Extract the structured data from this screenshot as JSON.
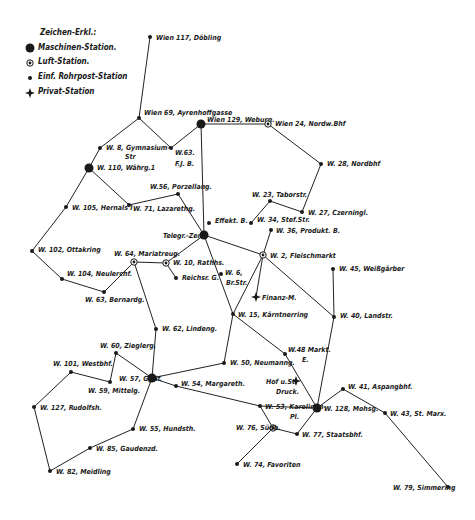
{
  "legend": {
    "title": "Zeichen-Erkl.:",
    "items": [
      {
        "symbol": "machine",
        "label": "Maschinen-Station."
      },
      {
        "symbol": "air",
        "label": "Luft-Station."
      },
      {
        "symbol": "simple",
        "label": "Einf. Rohrpost-Station"
      },
      {
        "symbol": "private",
        "label": "Privat-Station"
      }
    ]
  },
  "colors": {
    "ink": "#1a1a1a",
    "background": "#ffffff"
  },
  "nodes": [
    {
      "id": "w117",
      "label": "Wien 117, Döbling",
      "x": 150,
      "y": 37,
      "type": "simple",
      "lx": 156,
      "ly": 40
    },
    {
      "id": "w69",
      "label": "Wien 69, Ayrenhoffgasse",
      "x": 139,
      "y": 118,
      "type": "simple",
      "lx": 144,
      "ly": 115
    },
    {
      "id": "w129",
      "label": "Wien 129, Weburg.",
      "x": 201,
      "y": 124,
      "type": "machine",
      "lx": 207,
      "ly": 122
    },
    {
      "id": "w24",
      "label": "Wien 24, Nordw.Bhf",
      "x": 268,
      "y": 124,
      "type": "air",
      "lx": 275,
      "ly": 126
    },
    {
      "id": "w8",
      "label": "W. 8, Gymnasium-",
      "label2": "Str",
      "x": 100,
      "y": 148,
      "type": "simple",
      "lx": 106,
      "ly": 150,
      "l2x": 125,
      "l2y": 159
    },
    {
      "id": "w63a",
      "label": "W.63.",
      "label2": "F.J. B.",
      "x": 171,
      "y": 148,
      "type": "simple",
      "lx": 175,
      "ly": 155,
      "l2x": 175,
      "l2y": 166
    },
    {
      "id": "w28",
      "label": "W. 28, Nordbhf",
      "x": 321,
      "y": 164,
      "type": "simple",
      "lx": 327,
      "ly": 166
    },
    {
      "id": "w110",
      "label": "W. 110, Währg.1",
      "x": 89,
      "y": 168,
      "type": "machine",
      "lx": 97,
      "ly": 170
    },
    {
      "id": "w56",
      "label": "W.56, Porzellang.",
      "x": 178,
      "y": 194,
      "type": "simple",
      "lx": 150,
      "ly": 189
    },
    {
      "id": "w23",
      "label": "W. 23, Taborstr.",
      "x": 270,
      "y": 201,
      "type": "simple",
      "lx": 252,
      "ly": 197
    },
    {
      "id": "w105",
      "label": "W. 105, Hernals I",
      "x": 66,
      "y": 207,
      "type": "simple",
      "lx": 72,
      "ly": 210
    },
    {
      "id": "w71",
      "label": "W. 71, Lazarethg.",
      "x": 129,
      "y": 205,
      "type": "simple",
      "lx": 133,
      "ly": 211
    },
    {
      "id": "w27",
      "label": "W. 27, Czerningl.",
      "x": 302,
      "y": 212,
      "type": "simple",
      "lx": 308,
      "ly": 215
    },
    {
      "id": "effekt",
      "label": "Effekt. B.",
      "x": 209,
      "y": 223,
      "type": "simple",
      "lx": 215,
      "ly": 223
    },
    {
      "id": "w34",
      "label": "W. 34, Stef.Str.",
      "x": 251,
      "y": 223,
      "type": "simple",
      "lx": 257,
      "ly": 222
    },
    {
      "id": "w36",
      "label": "W. 36, Produkt. B.",
      "x": 271,
      "y": 230,
      "type": "simple",
      "lx": 276,
      "ly": 233
    },
    {
      "id": "telegr",
      "label": "Telegr.-Zent.",
      "x": 204,
      "y": 235,
      "type": "machine",
      "lx": 163,
      "ly": 238
    },
    {
      "id": "w102",
      "label": "W. 102, Ottakring",
      "x": 32,
      "y": 251,
      "type": "simple",
      "lx": 38,
      "ly": 252
    },
    {
      "id": "w64",
      "label": "W. 64, Mariahilf",
      "label_raw": "W. 64, Mariatreug.",
      "x": 134,
      "y": 262,
      "type": "air",
      "lx": 114,
      "ly": 256
    },
    {
      "id": "w10",
      "label": "W. 10, Rathhs.",
      "x": 166,
      "y": 263,
      "type": "air",
      "lx": 173,
      "ly": 265
    },
    {
      "id": "w2",
      "label": "W. 2, Fleischmarkt",
      "x": 263,
      "y": 255,
      "type": "air",
      "lx": 270,
      "ly": 258
    },
    {
      "id": "reichsr",
      "label": "Reichsr. G.",
      "x": 176,
      "y": 278,
      "type": "simple",
      "lx": 182,
      "ly": 280
    },
    {
      "id": "w45",
      "label": "W. 45, Weißgärber",
      "x": 333,
      "y": 269,
      "type": "simple",
      "lx": 339,
      "ly": 271
    },
    {
      "id": "w6",
      "label": "W. 6,",
      "label2": "Br.Str.",
      "x": 221,
      "y": 274,
      "type": "simple",
      "lx": 225,
      "ly": 275,
      "l2x": 226,
      "l2y": 285
    },
    {
      "id": "w104",
      "label": "W. 104, Neulerchf.",
      "x": 62,
      "y": 279,
      "type": "simple",
      "lx": 67,
      "ly": 276
    },
    {
      "id": "w63",
      "label": "W. 63, Bernardg.",
      "x": 104,
      "y": 292,
      "type": "simple",
      "lx": 85,
      "ly": 302
    },
    {
      "id": "finanz",
      "label": "Finanz-M.",
      "x": 256,
      "y": 297,
      "type": "private",
      "lx": 262,
      "ly": 300
    },
    {
      "id": "w15",
      "label": "W. 15, Kärntnerring",
      "x": 233,
      "y": 314,
      "type": "simple",
      "lx": 238,
      "ly": 317
    },
    {
      "id": "w40",
      "label": "W. 40, Landstr.",
      "x": 334,
      "y": 317,
      "type": "simple",
      "lx": 340,
      "ly": 318
    },
    {
      "id": "w62",
      "label": "W. 62, Lindeng.",
      "x": 156,
      "y": 329,
      "type": "simple",
      "lx": 162,
      "ly": 331
    },
    {
      "id": "w48",
      "label": "W.48 Markt.",
      "label2": "E.",
      "x": 285,
      "y": 354,
      "type": "simple",
      "lx": 288,
      "ly": 352,
      "l2x": 302,
      "l2y": 362
    },
    {
      "id": "w60",
      "label": "W. 60, Zieglerg.",
      "x": 116,
      "y": 353,
      "type": "simple",
      "lx": 100,
      "ly": 348
    },
    {
      "id": "w101",
      "label": "W. 101, Westbhf.",
      "x": 71,
      "y": 372,
      "type": "simple",
      "lx": 53,
      "ly": 366
    },
    {
      "id": "w50",
      "label": "W. 50, Neumanng.",
      "x": 224,
      "y": 363,
      "type": "simple",
      "lx": 230,
      "ly": 365
    },
    {
      "id": "w57",
      "label": "W. 57, Gpdf.",
      "x": 152,
      "y": 378,
      "type": "machine",
      "lx": 119,
      "ly": 381
    },
    {
      "id": "w59",
      "label": "W. 59, Mittelg.",
      "x": 110,
      "y": 382,
      "type": "simple",
      "lx": 88,
      "ly": 393
    },
    {
      "id": "w54",
      "label": "W. 54, Margareth.",
      "x": 176,
      "y": 386,
      "type": "simple",
      "lx": 181,
      "ly": 386
    },
    {
      "id": "hof",
      "label": "Hof u.St.",
      "label2": "Druck.",
      "x": 296,
      "y": 381,
      "type": "private",
      "lx": 266,
      "ly": 384,
      "l2x": 276,
      "l2y": 394
    },
    {
      "id": "w41",
      "label": "W. 41, Aspangbhf.",
      "x": 343,
      "y": 389,
      "type": "simple",
      "lx": 348,
      "ly": 389
    },
    {
      "id": "w127",
      "label": "W. 127, Rudolfsh.",
      "x": 34,
      "y": 407,
      "type": "simple",
      "lx": 40,
      "ly": 410
    },
    {
      "id": "w53",
      "label": "W. 53, Karolinen-",
      "label2": "Pl.",
      "x": 260,
      "y": 406,
      "type": "simple",
      "lx": 265,
      "ly": 409,
      "l2x": 290,
      "l2y": 419
    },
    {
      "id": "w128",
      "label": "W. 128, Mohsg.",
      "x": 317,
      "y": 408,
      "type": "machine",
      "lx": 324,
      "ly": 411
    },
    {
      "id": "w43",
      "label": "W. 43, St. Marx.",
      "x": 385,
      "y": 413,
      "type": "simple",
      "lx": 390,
      "ly": 416
    },
    {
      "id": "w55",
      "label": "W. 55, Hundsth.",
      "x": 133,
      "y": 429,
      "type": "simple",
      "lx": 139,
      "ly": 431
    },
    {
      "id": "w76",
      "label": "W. 76, Südb.",
      "x": 273,
      "y": 428,
      "type": "air",
      "lx": 236,
      "ly": 430
    },
    {
      "id": "w77",
      "label": "W. 77, Staatsbhf.",
      "x": 297,
      "y": 434,
      "type": "simple",
      "lx": 302,
      "ly": 437
    },
    {
      "id": "w85",
      "label": "W. 85, Gaudenzd.",
      "x": 90,
      "y": 448,
      "type": "simple",
      "lx": 96,
      "ly": 451
    },
    {
      "id": "w82",
      "label": "W. 82, Meidling",
      "x": 50,
      "y": 471,
      "type": "simple",
      "lx": 56,
      "ly": 474
    },
    {
      "id": "w74",
      "label": "W. 74, Favoriten",
      "x": 237,
      "y": 464,
      "type": "simple",
      "lx": 243,
      "ly": 467
    },
    {
      "id": "w79",
      "label": "W. 79, Simmering",
      "x": 448,
      "y": 487,
      "type": "simple",
      "lx": 393,
      "ly": 490
    }
  ],
  "edges": [
    [
      "w117",
      "w69"
    ],
    [
      "w69",
      "w8"
    ],
    [
      "w69",
      "w63a"
    ],
    [
      "w63a",
      "w129"
    ],
    [
      "w129",
      "w24"
    ],
    [
      "w24",
      "w28"
    ],
    [
      "w28",
      "w27"
    ],
    [
      "w27",
      "w23"
    ],
    [
      "w23",
      "w34"
    ],
    [
      "w129",
      "telegr"
    ],
    [
      "w8",
      "w110"
    ],
    [
      "w110",
      "w105"
    ],
    [
      "w110",
      "w71"
    ],
    [
      "w71",
      "w56"
    ],
    [
      "w56",
      "telegr"
    ],
    [
      "w105",
      "w102"
    ],
    [
      "w102",
      "w104"
    ],
    [
      "w104",
      "w63"
    ],
    [
      "w63",
      "w64"
    ],
    [
      "w64",
      "w10"
    ],
    [
      "w10",
      "telegr"
    ],
    [
      "w10",
      "reichsr"
    ],
    [
      "w64",
      "w62"
    ],
    [
      "w62",
      "w57"
    ],
    [
      "telegr",
      "w2"
    ],
    [
      "w36",
      "w2"
    ],
    [
      "telegr",
      "w15"
    ],
    [
      "w2",
      "finanz"
    ],
    [
      "w2",
      "w15"
    ],
    [
      "w2",
      "w40"
    ],
    [
      "w45",
      "w40"
    ],
    [
      "w40",
      "w128"
    ],
    [
      "w15",
      "w50"
    ],
    [
      "w15",
      "w48"
    ],
    [
      "w48",
      "w128"
    ],
    [
      "w50",
      "w57"
    ],
    [
      "w57",
      "w60"
    ],
    [
      "w60",
      "w59"
    ],
    [
      "w57",
      "w54"
    ],
    [
      "w54",
      "w53"
    ],
    [
      "w53",
      "w128"
    ],
    [
      "w57",
      "w55"
    ],
    [
      "w55",
      "w85"
    ],
    [
      "w85",
      "w82"
    ],
    [
      "w82",
      "w127"
    ],
    [
      "w127",
      "w101"
    ],
    [
      "w101",
      "w59"
    ],
    [
      "w128",
      "w41"
    ],
    [
      "w41",
      "w43"
    ],
    [
      "w43",
      "w79"
    ],
    [
      "w128",
      "w77"
    ],
    [
      "w77",
      "w76"
    ],
    [
      "w76",
      "w74"
    ],
    [
      "w76",
      "w53"
    ]
  ]
}
